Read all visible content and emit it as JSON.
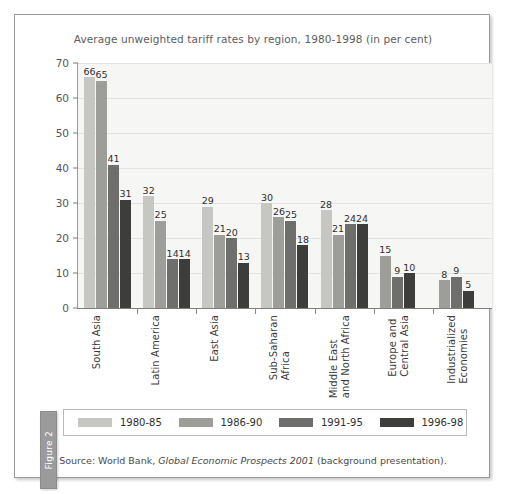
{
  "figure_tab": {
    "label": "Figure 2"
  },
  "chart_data": {
    "type": "bar",
    "title": "Average unweighted tariff rates by region, 1980-1998 (in per cent)",
    "xlabel": "",
    "ylabel": "",
    "ylim": [
      0,
      70
    ],
    "yticks": [
      0,
      10,
      20,
      30,
      40,
      50,
      60,
      70
    ],
    "grid": true,
    "legend_position": "bottom",
    "data_labels": true,
    "categories": [
      "South Asia",
      "Latin America",
      "East Asia",
      "Sub-Saharan\nAfrica",
      "Middle East\nand North Africa",
      "Europe and\nCentral Asia",
      "Industrialized\nEconomies"
    ],
    "series": [
      {
        "name": "1980-85",
        "color": "#c6c6c2",
        "values": [
          66,
          32,
          29,
          30,
          28,
          null,
          null
        ]
      },
      {
        "name": "1986-90",
        "color": "#9d9d99",
        "values": [
          65,
          25,
          21,
          26,
          21,
          15,
          8
        ]
      },
      {
        "name": "1991-95",
        "color": "#6e6e6c",
        "values": [
          41,
          14,
          20,
          25,
          24,
          9,
          9
        ]
      },
      {
        "name": "1996-98",
        "color": "#3d3d3c",
        "values": [
          31,
          14,
          13,
          18,
          24,
          10,
          5
        ]
      }
    ],
    "source_note_prefix": "Source: World Bank, ",
    "source_note_italic": "Global Economic Prospects 2001",
    "source_note_suffix": " (background presentation)."
  }
}
